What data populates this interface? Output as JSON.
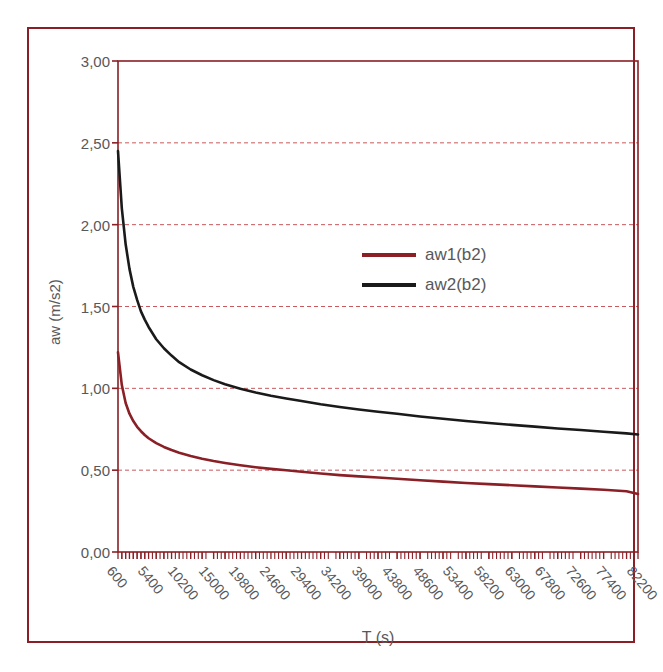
{
  "chart_data": {
    "type": "line",
    "title": "",
    "xlabel": "T (s)",
    "ylabel": "aw (m/s2)",
    "xlim": [
      600,
      82200
    ],
    "ylim": [
      0.0,
      3.0
    ],
    "grid": true,
    "grid_axis": "y",
    "legend_position": "center-right",
    "x_tick_labels": [
      "600",
      "5400",
      "10200",
      "15000",
      "19800",
      "24600",
      "29400",
      "34200",
      "39000",
      "43800",
      "48600",
      "53400",
      "58200",
      "63000",
      "67800",
      "72600",
      "77400",
      "82200"
    ],
    "y_tick_labels": [
      "0,00",
      "0,50",
      "1,00",
      "1,50",
      "2,00",
      "2,50",
      "3,00"
    ],
    "y_tick_values": [
      0.0,
      0.5,
      1.0,
      1.5,
      2.0,
      2.5,
      3.0
    ],
    "x": [
      600,
      1200,
      1800,
      2400,
      3000,
      3600,
      4200,
      4800,
      5400,
      6600,
      7800,
      9000,
      10200,
      12000,
      13800,
      15600,
      17400,
      19800,
      22200,
      24600,
      27000,
      29400,
      32400,
      35400,
      38400,
      41400,
      44400,
      48000,
      51600,
      55200,
      58800,
      62400,
      66000,
      69600,
      73200,
      76800,
      80400,
      82200
    ],
    "series": [
      {
        "name": "aw1(b2)",
        "color": "#8a2026",
        "values": [
          1.22,
          1.02,
          0.91,
          0.845,
          0.8,
          0.765,
          0.738,
          0.715,
          0.695,
          0.665,
          0.642,
          0.623,
          0.607,
          0.587,
          0.57,
          0.556,
          0.544,
          0.53,
          0.518,
          0.508,
          0.499,
          0.49,
          0.48,
          0.47,
          0.462,
          0.455,
          0.448,
          0.438,
          0.43,
          0.422,
          0.415,
          0.408,
          0.401,
          0.394,
          0.387,
          0.38,
          0.371,
          0.355
        ]
      },
      {
        "name": "aw2(b2)",
        "color": "#1a1a1a",
        "values": [
          2.45,
          2.1,
          1.88,
          1.73,
          1.62,
          1.54,
          1.47,
          1.42,
          1.375,
          1.3,
          1.245,
          1.2,
          1.16,
          1.115,
          1.08,
          1.05,
          1.025,
          0.998,
          0.975,
          0.955,
          0.938,
          0.923,
          0.903,
          0.886,
          0.871,
          0.857,
          0.845,
          0.828,
          0.814,
          0.8,
          0.788,
          0.777,
          0.766,
          0.755,
          0.745,
          0.735,
          0.725,
          0.718
        ]
      }
    ]
  },
  "axes": {
    "frame_color": "#8a2026",
    "gridline_color": "#c8585c",
    "tick_text_color": "#58585a"
  },
  "legend": {
    "entries": [
      {
        "label": "aw1(b2)",
        "color": "#8a2026"
      },
      {
        "label": "aw2(b2)",
        "color": "#1a1a1a"
      }
    ]
  }
}
